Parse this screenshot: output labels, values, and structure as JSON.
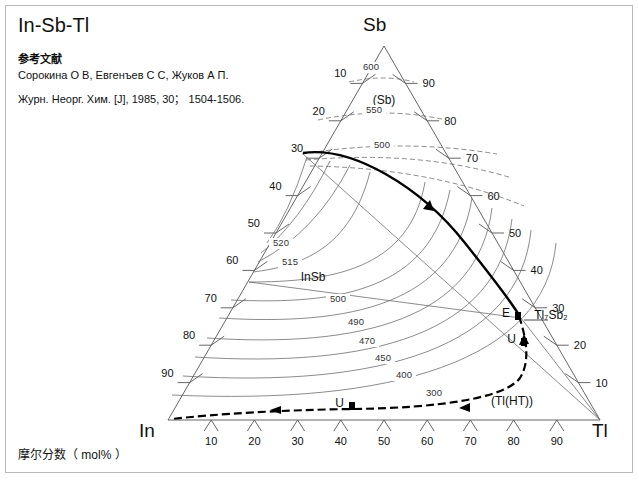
{
  "title": "In-Sb-Tl",
  "reference": {
    "heading": "参考文献",
    "authors": "Сорокина О В, Евгенъев С С, Жуков А П.",
    "source": "Журн. Неорг. Хим. [J], 1985, 30； 1504-1506."
  },
  "axis_caption": "摩尔分数（ mol% ）",
  "vertices": {
    "top": "Sb",
    "left": "In",
    "right": "Tl"
  },
  "chart_data": {
    "type": "ternary_phase_diagram",
    "title": "In-Sb-Tl",
    "components": [
      "In",
      "Sb",
      "Tl"
    ],
    "units": "mol%",
    "axis_label": "摩尔分数（ mol% ）",
    "tick_values": [
      10,
      20,
      30,
      40,
      50,
      60,
      70,
      80,
      90
    ],
    "left_axis_ticks": [
      10,
      20,
      30,
      40,
      50,
      60,
      70,
      80,
      90
    ],
    "right_axis_ticks": [
      90,
      80,
      70,
      60,
      50,
      40,
      30,
      20,
      10
    ],
    "bottom_axis_ticks": [
      10,
      20,
      30,
      40,
      50,
      60,
      70,
      80,
      90
    ],
    "phase_fields": [
      {
        "name": "(Sb)",
        "x": 384,
        "y": 104
      },
      {
        "name": "InSb",
        "x": 313,
        "y": 281
      },
      {
        "name": "Tl₇Sb₂",
        "x": 551,
        "y": 319
      },
      {
        "name": "(Tl(HT))",
        "x": 512,
        "y": 405
      }
    ],
    "isotherms_celsius": [
      600,
      550,
      500,
      520,
      515,
      500,
      490,
      470,
      450,
      400,
      300
    ],
    "isotherm_labels": [
      {
        "value": "600",
        "x": 371,
        "y": 70
      },
      {
        "value": "550",
        "x": 374,
        "y": 113
      },
      {
        "value": "500",
        "x": 382,
        "y": 148
      },
      {
        "value": "520",
        "x": 281,
        "y": 246
      },
      {
        "value": "515",
        "x": 290,
        "y": 265
      },
      {
        "value": "500",
        "x": 338,
        "y": 302
      },
      {
        "value": "490",
        "x": 356,
        "y": 325
      },
      {
        "value": "470",
        "x": 367,
        "y": 344
      },
      {
        "value": "450",
        "x": 383,
        "y": 361
      },
      {
        "value": "400",
        "x": 404,
        "y": 378
      },
      {
        "value": "300",
        "x": 434,
        "y": 396
      }
    ],
    "invariant_points": [
      {
        "label": "E",
        "x": 518,
        "y": 316,
        "type": "eutectic"
      },
      {
        "label": "U",
        "x": 524,
        "y": 342,
        "type": "transition"
      },
      {
        "label": "U",
        "x": 352,
        "y": 406,
        "type": "transition"
      }
    ],
    "boundary_curves": [
      {
        "name": "InSb-Sb liquidus boundary",
        "style": "bold-solid"
      },
      {
        "name": "Tl-rich monovariant",
        "style": "bold-dashed"
      }
    ]
  }
}
